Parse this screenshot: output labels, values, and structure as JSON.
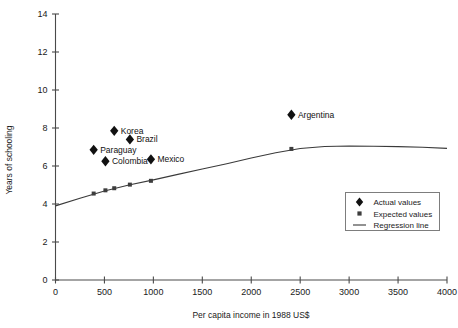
{
  "chart_data": {
    "type": "scatter",
    "title": "",
    "xlabel": "Per capita income in 1988 US$",
    "ylabel": "Years of schooling",
    "xlim": [
      0,
      4000
    ],
    "ylim": [
      0,
      14
    ],
    "xticks": [
      "0",
      "500",
      "1000",
      "1500",
      "2000",
      "2500",
      "3000",
      "3500",
      "4000"
    ],
    "yticks": [
      "0",
      "2",
      "4",
      "6",
      "8",
      "10",
      "12",
      "14"
    ],
    "grid": false,
    "legend_position": "lower-right",
    "series": [
      {
        "name": "Actual values",
        "marker": "diamond",
        "points": [
          {
            "label": "Korea",
            "x": 600,
            "y": 7.85,
            "label_side": "right"
          },
          {
            "label": "Brazil",
            "x": 760,
            "y": 7.4,
            "label_side": "right"
          },
          {
            "label": "Paraguay",
            "x": 390,
            "y": 6.85,
            "label_side": "right"
          },
          {
            "label": "Colombia",
            "x": 510,
            "y": 6.25,
            "label_side": "right"
          },
          {
            "label": "Mexico",
            "x": 975,
            "y": 6.35,
            "label_side": "right"
          },
          {
            "label": "Argentina",
            "x": 2410,
            "y": 8.7,
            "label_side": "right"
          }
        ]
      },
      {
        "name": "Expected values",
        "marker": "square",
        "points": [
          {
            "label": "",
            "x": 390,
            "y": 4.55
          },
          {
            "label": "",
            "x": 510,
            "y": 4.72
          },
          {
            "label": "",
            "x": 600,
            "y": 4.83
          },
          {
            "label": "",
            "x": 760,
            "y": 5.02
          },
          {
            "label": "",
            "x": 975,
            "y": 5.22
          },
          {
            "label": "",
            "x": 2410,
            "y": 6.9
          }
        ]
      }
    ],
    "regression_line": {
      "name": "Regression line",
      "points": [
        {
          "x": 0,
          "y": 3.9
        },
        {
          "x": 250,
          "y": 4.3
        },
        {
          "x": 500,
          "y": 4.68
        },
        {
          "x": 750,
          "y": 5.0
        },
        {
          "x": 1000,
          "y": 5.27
        },
        {
          "x": 1250,
          "y": 5.56
        },
        {
          "x": 1500,
          "y": 5.84
        },
        {
          "x": 1750,
          "y": 6.12
        },
        {
          "x": 2000,
          "y": 6.42
        },
        {
          "x": 2250,
          "y": 6.7
        },
        {
          "x": 2500,
          "y": 6.92
        },
        {
          "x": 2750,
          "y": 7.03
        },
        {
          "x": 3000,
          "y": 7.05
        },
        {
          "x": 3250,
          "y": 7.04
        },
        {
          "x": 3500,
          "y": 7.02
        },
        {
          "x": 3750,
          "y": 6.99
        },
        {
          "x": 4000,
          "y": 6.93
        }
      ]
    },
    "legend": [
      {
        "label": "Actual values",
        "marker": "diamond"
      },
      {
        "label": "Expected values",
        "marker": "square"
      },
      {
        "label": "Regression line",
        "marker": "line"
      }
    ]
  },
  "colors": {
    "marker_actual": "#111111",
    "marker_expected": "#3d3d3d",
    "regression": "#3a3a3a",
    "axis": "#4a4a4a",
    "legend_border": "#7d7d7d",
    "background": "#ffffff",
    "text": "#1a1a1a"
  }
}
